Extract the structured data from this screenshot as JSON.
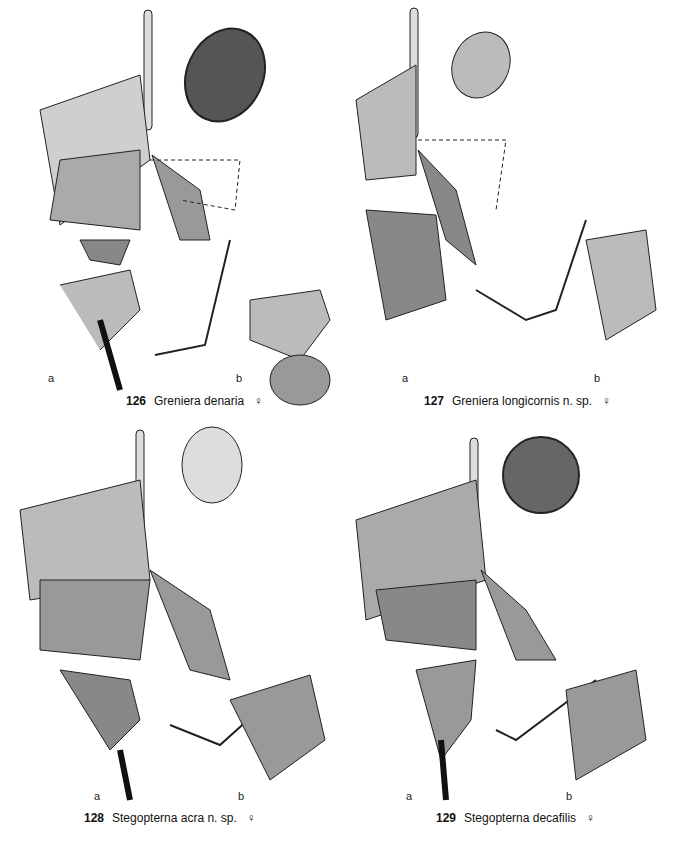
{
  "figures": [
    {
      "number": "126",
      "species": "Greniera denaria",
      "sex": "♀",
      "labels": [
        "a",
        "b"
      ],
      "spermatheca": "ovoid-striate"
    },
    {
      "number": "127",
      "species": "Greniera longicornis n. sp.",
      "sex": "♀",
      "labels": [
        "a",
        "b"
      ],
      "spermatheca": "small-ovoid"
    },
    {
      "number": "128",
      "species": "Stegopterna acra n. sp.",
      "sex": "♀",
      "labels": [
        "a",
        "b"
      ],
      "spermatheca": "reticulate"
    },
    {
      "number": "129",
      "species": "Stegopterna decafilis",
      "sex": "♀",
      "labels": [
        "a",
        "b"
      ],
      "spermatheca": "spherical-dark"
    }
  ]
}
